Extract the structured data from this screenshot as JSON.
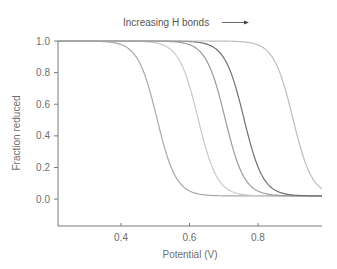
{
  "chart_data": {
    "type": "line",
    "title": "",
    "annotation": "Increasing H bonds",
    "annotation_arrow": "right-arrow",
    "xlabel": "Potential (V)",
    "ylabel": "Fraction reduced",
    "xlim": [
      0.216,
      0.987
    ],
    "ylim": [
      -0.17,
      1.0
    ],
    "xticks": [
      0.4,
      0.6,
      0.8
    ],
    "xtick_labels": [
      "0.4",
      "0.6",
      "0.8"
    ],
    "yticks": [
      0.0,
      0.2,
      0.4,
      0.6,
      0.8,
      1.0
    ],
    "ytick_labels": [
      "0.0",
      "0.2",
      "0.4",
      "0.6",
      "0.8",
      "1.0"
    ],
    "grid": false,
    "legend": "none",
    "series": [
      {
        "name": "curve-1",
        "midpoint_V": 0.505,
        "top": 1.0,
        "bottom": 0.02,
        "color": "#a8a8a8"
      },
      {
        "name": "curve-2",
        "midpoint_V": 0.625,
        "top": 1.0,
        "bottom": 0.02,
        "color": "#c8c8c8"
      },
      {
        "name": "curve-3",
        "midpoint_V": 0.704,
        "top": 1.0,
        "bottom": 0.02,
        "color": "#9a9a9a"
      },
      {
        "name": "curve-4",
        "midpoint_V": 0.759,
        "top": 1.0,
        "bottom": 0.02,
        "color": "#707070"
      },
      {
        "name": "curve-5",
        "midpoint_V": 0.902,
        "top": 1.0,
        "bottom": 0.02,
        "color": "#bdbdbd"
      }
    ]
  }
}
